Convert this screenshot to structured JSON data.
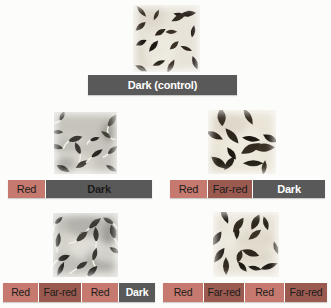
{
  "colors": {
    "red_segment": "#c5796f",
    "far_red_segment": "#9a5a50",
    "dark_segment": "#595959",
    "light_text": "#ffffff",
    "dark_text": "#1c1c1c"
  },
  "panels": [
    {
      "name": "dark-control",
      "photo": {
        "state": "ungerminated",
        "seed_count": 17
      },
      "bar": [
        {
          "label": "Dark (control)"
        }
      ]
    },
    {
      "name": "red-dark",
      "photo": {
        "state": "germinated",
        "seed_count": 13
      },
      "bar": [
        {
          "label": "Red"
        },
        {
          "label": "Dark"
        }
      ]
    },
    {
      "name": "red-farred-dark",
      "photo": {
        "state": "ungerminated",
        "seed_count": 13
      },
      "bar": [
        {
          "label": "Red"
        },
        {
          "label": "Far-red"
        },
        {
          "label": "Dark"
        }
      ]
    },
    {
      "name": "red-farred-red-dark",
      "photo": {
        "state": "germinated",
        "seed_count": 13
      },
      "bar": [
        {
          "label": "Red"
        },
        {
          "label": "Far-red"
        },
        {
          "label": "Red"
        },
        {
          "label": "Dark"
        }
      ]
    },
    {
      "name": "red-farred-red-farred",
      "photo": {
        "state": "ungerminated",
        "seed_count": 15
      },
      "bar": [
        {
          "label": "Red"
        },
        {
          "label": "Far-red"
        },
        {
          "label": "Red"
        },
        {
          "label": "Far-red"
        }
      ]
    }
  ]
}
